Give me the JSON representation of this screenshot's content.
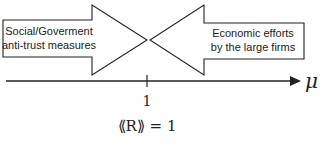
{
  "diagram": {
    "left_arrow": {
      "line1": "Social/Goverment",
      "line2": "anti-trust measures",
      "direction": "right"
    },
    "right_arrow": {
      "line1": "Economic efforts",
      "line2": "by the large firms",
      "direction": "left"
    },
    "axis": {
      "label": "μ",
      "tick_value": "1",
      "tick_annotation": "⟪R⟫ = 1"
    },
    "colors": {
      "stroke": "#222222",
      "fill": "#ffffff"
    }
  }
}
